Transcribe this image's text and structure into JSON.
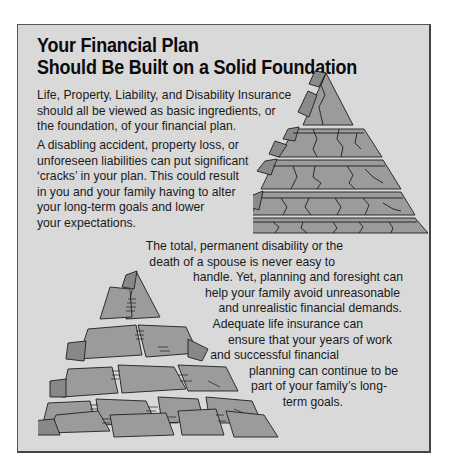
{
  "title": {
    "line1": "Your Financial Plan",
    "line2": "Should Be Built on a Solid Foundation"
  },
  "paragraph1": {
    "lines": [
      "Life, Property, Liability, and Disability Insurance",
      "should all be viewed as basic ingredients, or",
      "the foundation, of your financial plan."
    ]
  },
  "paragraph2": {
    "lines": [
      "A disabling accident, property loss, or",
      "unforeseen liabilities can put significant",
      "‘cracks’ in your plan. This could result",
      "in you and your family having to alter",
      "your long-term goals and lower",
      "your expectations."
    ]
  },
  "paragraph3": {
    "lines": [
      "The total, permanent disability or the",
      "death of a spouse is never easy to",
      "handle. Yet, planning and foresight can",
      "help your family avoid unreasonable",
      "and unrealistic financial demands.",
      "Adequate life insurance can",
      "ensure that your years of work",
      "and successful financial",
      "planning can continue to be",
      "part of your family’s long-",
      "term goals."
    ],
    "right_offsets": [
      70,
      78,
      10,
      13,
      11,
      50,
      21,
      74,
      15,
      26,
      70
    ]
  },
  "illustrations": {
    "cracked_pyramid": "cracked-stone-pyramid",
    "collapsed_pyramid": "collapsed-stone-pyramid"
  },
  "colors": {
    "panel_bg": "#d9d9d9",
    "stone": "#9b9b9b",
    "stone_dark": "#7f7f7f",
    "outline": "#1e1e1e"
  }
}
